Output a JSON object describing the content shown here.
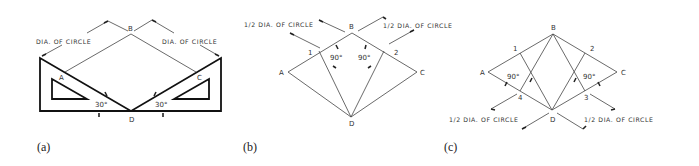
{
  "figure": {
    "panels": [
      {
        "id": "a",
        "caption": "(a)",
        "points": {
          "A": "A",
          "B": "B",
          "C": "C",
          "D": "D"
        },
        "dim_left": "DIA. OF CIRCLE",
        "dim_right": "DIA. OF CIRCLE",
        "angle_left": "30°",
        "angle_right": "30°"
      },
      {
        "id": "b",
        "caption": "(b)",
        "points": {
          "A": "A",
          "B": "B",
          "C": "C",
          "D": "D",
          "p1": "1",
          "p2": "2"
        },
        "dim_left": "1/2 DIA. OF CIRCLE",
        "dim_right": "1/2 DIA. OF CIRCLE",
        "angle_left": "90°",
        "angle_right": "90°"
      },
      {
        "id": "c",
        "caption": "(c)",
        "points": {
          "A": "A",
          "B": "B",
          "C": "C",
          "D": "D",
          "p1": "1",
          "p2": "2",
          "p3": "3",
          "p4": "4"
        },
        "dim_left": "1/2 DIA. OF CIRCLE",
        "dim_right": "1/2 DIA. OF CIRCLE",
        "angle_left": "90°",
        "angle_right": "90°"
      }
    ]
  }
}
